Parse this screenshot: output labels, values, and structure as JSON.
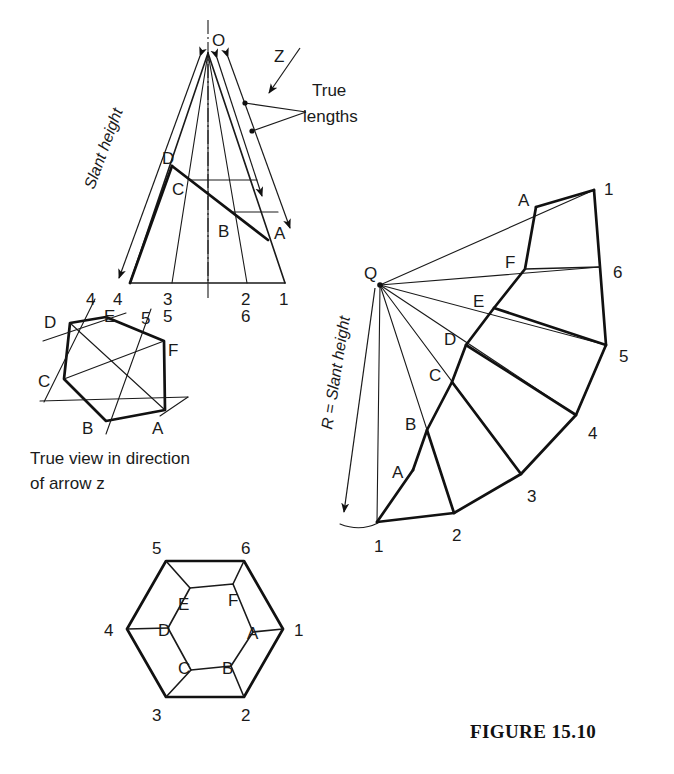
{
  "figure": {
    "caption": "FIGURE 15.10",
    "caption_pos": {
      "x": 470,
      "y": 738
    }
  },
  "annotations": {
    "slant_height": "Slant height",
    "slant_height_dev": "R = Slant height",
    "true_lengths_line1": "True",
    "true_lengths_line2": "lengths",
    "arrow_z": "Z",
    "true_view_line1": "True view in direction",
    "true_view_line2": "of arrow z"
  },
  "elevation": {
    "name": "front-elevation-of-cut-cone",
    "apex_label": "O",
    "apex": {
      "x": 208,
      "y": 53
    },
    "base_left": {
      "x": 130,
      "y": 283
    },
    "base_right": {
      "x": 285,
      "y": 283
    },
    "base_labels": [
      {
        "text": "4",
        "x": 118,
        "y": 303
      },
      {
        "text": "3",
        "x": 168,
        "y": 303
      },
      {
        "text": "2",
        "x": 245,
        "y": 303
      },
      {
        "text": "6",
        "x": 245,
        "y": 320
      },
      {
        "text": "1",
        "x": 283,
        "y": 303
      },
      {
        "text": "5",
        "x": 168,
        "y": 320
      }
    ],
    "generator_feet_x": [
      130,
      172,
      208,
      247,
      285
    ],
    "cut_line": {
      "from": {
        "x": 172,
        "y": 166
      },
      "to": {
        "x": 268,
        "y": 240
      }
    },
    "cut_labels": [
      {
        "text": "D",
        "x": 168,
        "y": 160
      },
      {
        "text": "C",
        "x": 176,
        "y": 191
      },
      {
        "text": "B",
        "x": 223,
        "y": 232
      },
      {
        "text": "A",
        "x": 277,
        "y": 234
      }
    ]
  },
  "true_view": {
    "name": "true-view-hexagon",
    "vertices": [
      {
        "label": "D",
        "x": 70,
        "y": 323,
        "lx": 48,
        "ly": 321
      },
      {
        "label": "E",
        "x": 106,
        "y": 317,
        "lx": 111,
        "ly": 315
      },
      {
        "label": "F",
        "x": 164,
        "y": 341,
        "lx": 171,
        "ly": 351
      },
      {
        "label": "A",
        "x": 165,
        "y": 410,
        "lx": 157,
        "ly": 430
      },
      {
        "label": "B",
        "x": 106,
        "y": 421,
        "lx": 86,
        "ly": 429
      },
      {
        "label": "C",
        "x": 64,
        "y": 379,
        "lx": 42,
        "ly": 381
      }
    ],
    "ray_labels": [
      {
        "text": "4",
        "x": 90,
        "y": 305
      },
      {
        "text": "5",
        "x": 145,
        "y": 321
      }
    ]
  },
  "plan_view": {
    "name": "plan-view-hexagon",
    "outer": [
      {
        "label": "1",
        "x": 283,
        "y": 629,
        "lx": 297,
        "ly": 635
      },
      {
        "label": "2",
        "x": 244,
        "y": 697,
        "lx": 246,
        "ly": 719
      },
      {
        "label": "3",
        "x": 166,
        "y": 697,
        "lx": 157,
        "ly": 719
      },
      {
        "label": "4",
        "x": 127,
        "y": 629,
        "lx": 108,
        "ly": 635
      },
      {
        "label": "5",
        "x": 166,
        "y": 561,
        "lx": 157,
        "ly": 551
      },
      {
        "label": "6",
        "x": 244,
        "y": 561,
        "lx": 246,
        "ly": 551
      }
    ],
    "inner": [
      {
        "label": "A",
        "x": 253,
        "y": 632,
        "lx": 253,
        "ly": 638
      },
      {
        "label": "B",
        "x": 231,
        "y": 666,
        "lx": 228,
        "ly": 672
      },
      {
        "label": "C",
        "x": 191,
        "y": 670,
        "lx": 183,
        "ly": 670
      },
      {
        "label": "D",
        "x": 168,
        "y": 628,
        "lx": 164,
        "ly": 634
      },
      {
        "label": "E",
        "x": 190,
        "y": 588,
        "lx": 183,
        "ly": 609
      },
      {
        "label": "F",
        "x": 233,
        "y": 584,
        "lx": 232,
        "ly": 604
      }
    ]
  },
  "development": {
    "name": "surface-development-sector",
    "centre_label": "Q",
    "centre": {
      "x": 380,
      "y": 285
    },
    "centre_label_pos": {
      "x": 366,
      "y": 273
    },
    "outer_points": [
      {
        "label": "1",
        "x": 594,
        "y": 190,
        "lx": 607,
        "ly": 186
      },
      {
        "label": "6",
        "x": 600,
        "y": 267,
        "lx": 617,
        "ly": 272
      },
      {
        "label": "5",
        "x": 606,
        "y": 345,
        "lx": 623,
        "ly": 356
      },
      {
        "label": "4",
        "x": 576,
        "y": 415,
        "lx": 592,
        "ly": 433
      },
      {
        "label": "3",
        "x": 521,
        "y": 474,
        "lx": 531,
        "ly": 496
      },
      {
        "label": "2",
        "x": 454,
        "y": 513,
        "lx": 456,
        "ly": 535
      },
      {
        "label": "1",
        "x": 377,
        "y": 522,
        "lx": 378,
        "ly": 546
      }
    ],
    "cut_points": [
      {
        "label": "A",
        "x": 536,
        "y": 207,
        "lx": 524,
        "ly": 203
      },
      {
        "label": "F",
        "x": 525,
        "y": 269,
        "lx": 511,
        "ly": 265
      },
      {
        "label": "E",
        "x": 494,
        "y": 308,
        "lx": 479,
        "ly": 304
      },
      {
        "label": "D",
        "x": 466,
        "y": 345,
        "lx": 450,
        "ly": 342
      },
      {
        "label": "C",
        "x": 452,
        "y": 382,
        "lx": 434,
        "ly": 378
      },
      {
        "label": "B",
        "x": 427,
        "y": 430,
        "lx": 411,
        "ly": 427
      },
      {
        "label": "A",
        "x": 413,
        "y": 470,
        "lx": 398,
        "ly": 474
      }
    ]
  }
}
